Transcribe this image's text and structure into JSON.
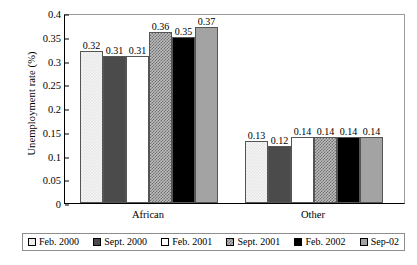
{
  "chart_data": {
    "type": "bar",
    "title": "",
    "xlabel": "",
    "ylabel": "Unemployment rate (%)",
    "ylim": [
      0,
      0.4
    ],
    "ytick_labels": [
      "0",
      "0.05",
      "0.1",
      "0.15",
      "0.2",
      "0.25",
      "0.3",
      "0.35",
      "0.4"
    ],
    "ytick_values": [
      0,
      0.05,
      0.1,
      0.15,
      0.2,
      0.25,
      0.3,
      0.35,
      0.4
    ],
    "grid": false,
    "legend_position": "bottom",
    "categories": [
      "African",
      "Other"
    ],
    "series": [
      {
        "name": "Feb. 2000",
        "pattern": "light-checker",
        "values": [
          0.32,
          0.13
        ],
        "labels": [
          "0.32",
          "0.13"
        ]
      },
      {
        "name": "Sept. 2000",
        "pattern": "dark-gray-solid",
        "values": [
          0.31,
          0.12
        ],
        "labels": [
          "0.31",
          "0.12"
        ]
      },
      {
        "name": "Feb. 2001",
        "pattern": "white-solid",
        "values": [
          0.31,
          0.14
        ],
        "labels": [
          "0.31",
          "0.14"
        ]
      },
      {
        "name": "Sept. 2001",
        "pattern": "medium-checker",
        "values": [
          0.36,
          0.14
        ],
        "labels": [
          "0.36",
          "0.14"
        ]
      },
      {
        "name": "Feb. 2002",
        "pattern": "black-solid",
        "values": [
          0.35,
          0.14
        ],
        "labels": [
          "0.35",
          "0.14"
        ]
      },
      {
        "name": "Sep-02",
        "pattern": "medium-gray-solid",
        "values": [
          0.37,
          0.14
        ],
        "labels": [
          "0.37",
          "0.14"
        ]
      }
    ]
  },
  "colors": {
    "series_1": "#f4f4f4",
    "series_2": "#4b4b4b",
    "series_3": "#ffffff",
    "series_4": "#bdbdbd",
    "series_5": "#000000",
    "series_6": "#a3a3a3",
    "axis": "#000000",
    "frame": "#9a9a9a",
    "background": "#ffffff"
  }
}
